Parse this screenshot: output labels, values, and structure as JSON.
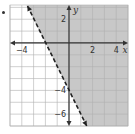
{
  "chart_data": {
    "type": "line",
    "title": "",
    "xlabel": "x",
    "ylabel": "y",
    "xlim": [
      -5,
      5
    ],
    "ylim": [
      -7,
      3.2
    ],
    "grid": true,
    "x_tick_labels": [
      {
        "value": -4,
        "label": "−4"
      },
      {
        "value": 2,
        "label": "2"
      },
      {
        "value": 4,
        "label": "4"
      }
    ],
    "y_tick_labels": [
      {
        "value": 2,
        "label": "2"
      },
      {
        "value": -4,
        "label": "−4"
      },
      {
        "value": -6,
        "label": "−6"
      }
    ],
    "boundary_line": {
      "equation": "y = -2x - 4",
      "slope": -2,
      "intercept": -4,
      "style": "dashed",
      "points": [
        [
          -2,
          0
        ],
        [
          0,
          -4
        ]
      ]
    },
    "inequality": "y > -2x - 4",
    "shaded_region": "right/above of boundary line",
    "colors": {
      "shade": "#c8c8c8",
      "grid": "#b0b0b0",
      "axis": "#333333",
      "line": "#222222"
    }
  }
}
